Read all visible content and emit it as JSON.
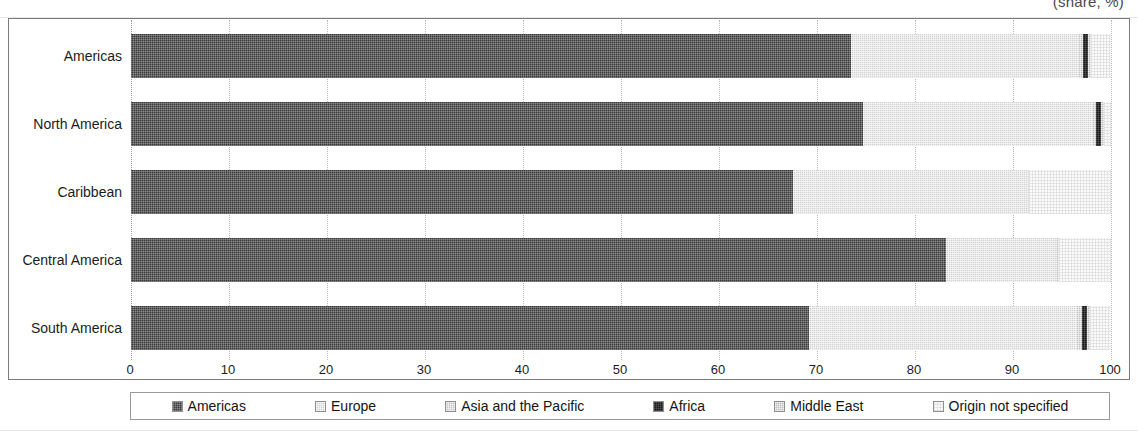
{
  "units_caption": "(share, %)",
  "chart_data": {
    "type": "bar",
    "orientation": "horizontal",
    "stacked": true,
    "title": "",
    "subtitle": "",
    "units": "(share, %)",
    "xlabel": "",
    "ylabel": "",
    "xlim": [
      0,
      100
    ],
    "xticks": [
      "0",
      "10",
      "20",
      "30",
      "40",
      "50",
      "60",
      "70",
      "80",
      "90",
      "100"
    ],
    "grid": true,
    "legend_position": "bottom",
    "categories": [
      "Americas",
      "North America",
      "Caribbean",
      "Central America",
      "South America"
    ],
    "series": [
      {
        "name": "Americas",
        "key": "americas",
        "color": "#3a3a3a",
        "values": [
          73.5,
          74.8,
          67.5,
          83.2,
          69.3
        ]
      },
      {
        "name": "Europe",
        "key": "europe",
        "color": "#d3d3d3",
        "values": [
          23.2,
          23.4,
          24.1,
          11.3,
          27.2
        ]
      },
      {
        "name": "Asia and the Pacific",
        "key": "asia",
        "color": "#c4c4c4",
        "values": [
          0.5,
          0.4,
          0.0,
          0.2,
          0.6
        ]
      },
      {
        "name": "Africa",
        "key": "africa",
        "color": "#161616",
        "values": [
          0.6,
          0.5,
          0.0,
          0.0,
          0.6
        ]
      },
      {
        "name": "Middle East",
        "key": "middleeast",
        "color": "#bdbdbd",
        "values": [
          0.2,
          0.2,
          0.0,
          0.0,
          0.2
        ]
      },
      {
        "name": "Origin not specified",
        "key": "unspecified",
        "color": "#fbfbfb",
        "values": [
          2.0,
          0.7,
          8.4,
          5.3,
          2.1
        ]
      }
    ]
  },
  "legend": {
    "items": [
      {
        "label": "Americas"
      },
      {
        "label": "Europe"
      },
      {
        "label": "Asia and the Pacific"
      },
      {
        "label": "Africa"
      },
      {
        "label": "Middle East"
      },
      {
        "label": "Origin not specified"
      }
    ]
  }
}
